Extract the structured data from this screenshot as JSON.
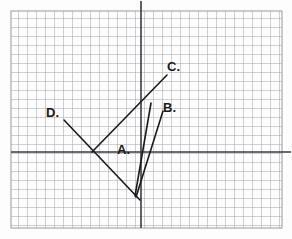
{
  "figure": {
    "kind": "hand-drawn-graph-on-grid-paper",
    "background_color": "#fdfdfd",
    "grid": {
      "line_color": "#9a9aa2",
      "cell_size_px": 9,
      "left": 11,
      "top": 11,
      "right": 282,
      "bottom": 228,
      "columns": 30,
      "rows": 24
    },
    "axes": {
      "color": "#3a3a42",
      "x_axis": {
        "y": 152,
        "x_start": 11,
        "x_end": 291
      },
      "y_axis": {
        "x": 141,
        "y_start": 1,
        "y_end": 228
      },
      "origin": {
        "x": 141,
        "y": 152
      }
    },
    "segments": [
      {
        "id": "A",
        "label": "A.",
        "color": "#1a1a1a",
        "width": 1.6,
        "x1": 135,
        "y1": 196,
        "x2": 151,
        "y2": 103
      },
      {
        "id": "B",
        "label": "B.",
        "color": "#1a1a1a",
        "width": 1.6,
        "x1": 136,
        "y1": 197,
        "x2": 163,
        "y2": 111
      },
      {
        "id": "C",
        "label": "C.",
        "color": "#1a1a1a",
        "width": 1.6,
        "x1": 92,
        "y1": 152,
        "x2": 167,
        "y2": 75
      },
      {
        "id": "D",
        "label": "D.",
        "color": "#1a1a1a",
        "width": 1.6,
        "x1": 64,
        "y1": 120,
        "x2": 140,
        "y2": 200
      }
    ],
    "labels": [
      {
        "id": "A",
        "text": "A.",
        "x": 117,
        "y": 143
      },
      {
        "id": "B",
        "text": "B.",
        "x": 163,
        "y": 101
      },
      {
        "id": "C",
        "text": "C.",
        "x": 167,
        "y": 60
      },
      {
        "id": "D",
        "text": "D.",
        "x": 46,
        "y": 106
      }
    ]
  }
}
